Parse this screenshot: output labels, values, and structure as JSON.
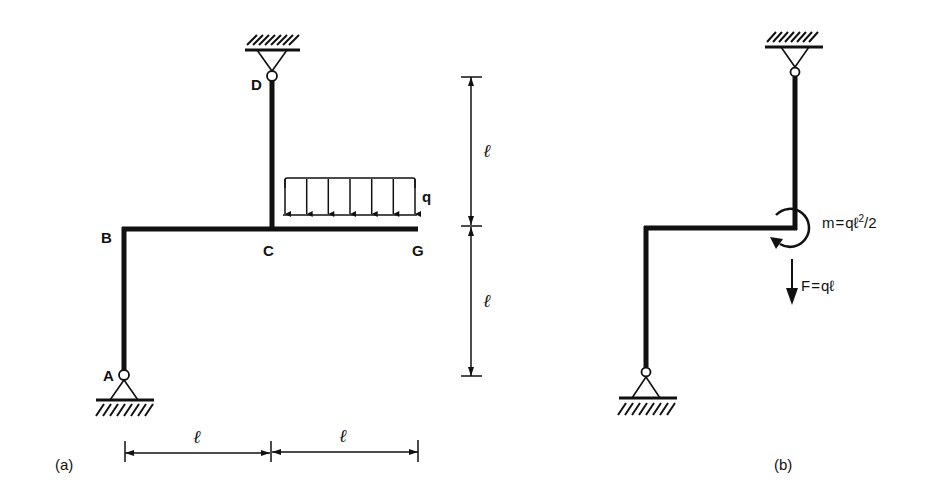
{
  "figure_a": {
    "caption": "(a)",
    "nodes": {
      "A": "A",
      "B": "B",
      "C": "C",
      "D": "D",
      "G": "G"
    },
    "load_label": "q",
    "dimensions": {
      "vertical_upper": "ℓ",
      "vertical_lower": "ℓ",
      "horizontal_left": "ℓ",
      "horizontal_right": "ℓ"
    },
    "supports": [
      "pin-support-D-top",
      "pin-support-A-bottom"
    ],
    "distributed_load_arrows": 7
  },
  "figure_b": {
    "caption": "(b)",
    "moment_label": "m = qℓ²/2",
    "moment_m": "m",
    "moment_eq": "=",
    "moment_expr_q": "qℓ",
    "moment_expr_exp": "2",
    "moment_expr_tail": "/2",
    "force_label_F": "F",
    "force_label_eq": "=",
    "force_label_expr": "qℓ"
  },
  "colors": {
    "ink": "#111111",
    "background": "#ffffff"
  }
}
